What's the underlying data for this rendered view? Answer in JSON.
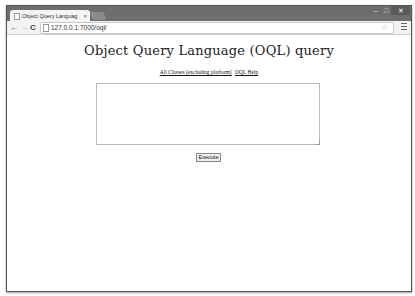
{
  "browser": {
    "tab_title": "Object Query Languag",
    "tab_close": "×",
    "url": "127.0.0.1:7000/oql/",
    "icons": {
      "back": "←",
      "forward": "→",
      "reload": "C",
      "star": "☆",
      "minimize": "–",
      "maximize": "□",
      "close": "✕"
    }
  },
  "page": {
    "title": "Object Query Language (OQL) query",
    "links": [
      {
        "label": "All Classes (excluding platform)"
      },
      {
        "label": "OQL Help"
      }
    ],
    "query_input": {
      "value": "",
      "placeholder": ""
    },
    "execute_label": "Execute"
  }
}
